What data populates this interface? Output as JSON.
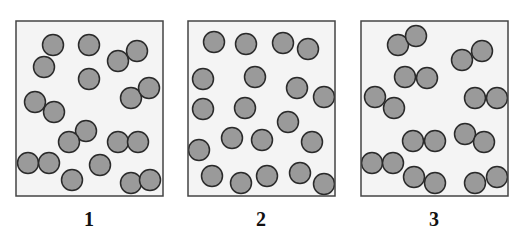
{
  "figure": {
    "colors": {
      "box_fill": "#f4f4f4",
      "box_stroke": "#444444",
      "particle_fill": "#9a9a9a",
      "particle_stroke": "#2a2a2a"
    },
    "particle_radius": 10.5,
    "panels": [
      {
        "label": "1",
        "box": {
          "x": 16,
          "y": 21,
          "w": 147,
          "h": 175
        },
        "label_x": 89,
        "particles": [
          [
            53,
            45
          ],
          [
            89,
            45
          ],
          [
            118,
            61
          ],
          [
            137,
            51
          ],
          [
            44,
            67
          ],
          [
            89,
            79
          ],
          [
            131,
            98
          ],
          [
            149,
            88
          ],
          [
            35,
            102
          ],
          [
            54,
            112
          ],
          [
            86,
            131
          ],
          [
            69,
            142
          ],
          [
            118,
            142
          ],
          [
            138,
            142
          ],
          [
            28,
            163
          ],
          [
            49,
            163
          ],
          [
            100,
            165
          ],
          [
            72,
            180
          ],
          [
            131,
            183
          ],
          [
            150,
            180
          ]
        ]
      },
      {
        "label": "2",
        "box": {
          "x": 188,
          "y": 21,
          "w": 147,
          "h": 175
        },
        "label_x": 261,
        "particles": [
          [
            214,
            42
          ],
          [
            246,
            44
          ],
          [
            283,
            43
          ],
          [
            308,
            49
          ],
          [
            203,
            79
          ],
          [
            255,
            77
          ],
          [
            297,
            88
          ],
          [
            324,
            97
          ],
          [
            203,
            109
          ],
          [
            245,
            108
          ],
          [
            288,
            122
          ],
          [
            232,
            138
          ],
          [
            262,
            140
          ],
          [
            312,
            142
          ],
          [
            199,
            150
          ],
          [
            212,
            176
          ],
          [
            241,
            183
          ],
          [
            267,
            176
          ],
          [
            300,
            173
          ],
          [
            324,
            184
          ]
        ]
      },
      {
        "label": "3",
        "box": {
          "x": 361,
          "y": 21,
          "w": 147,
          "h": 175
        },
        "label_x": 434,
        "particles": [
          [
            398,
            45
          ],
          [
            416,
            36
          ],
          [
            462,
            60
          ],
          [
            482,
            51
          ],
          [
            405,
            77
          ],
          [
            427,
            78
          ],
          [
            375,
            97
          ],
          [
            394,
            108
          ],
          [
            475,
            98
          ],
          [
            497,
            98
          ],
          [
            413,
            141
          ],
          [
            435,
            141
          ],
          [
            465,
            134
          ],
          [
            484,
            142
          ],
          [
            372,
            163
          ],
          [
            393,
            163
          ],
          [
            414,
            177
          ],
          [
            435,
            183
          ],
          [
            475,
            183
          ],
          [
            497,
            177
          ]
        ]
      }
    ]
  }
}
